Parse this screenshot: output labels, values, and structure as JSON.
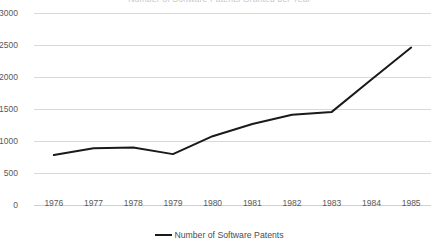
{
  "chart_data": {
    "type": "line",
    "title": "Number of Software Patents Granted per Year",
    "xlabel": "",
    "ylabel": "",
    "categories": [
      "1976",
      "1977",
      "1978",
      "1979",
      "1980",
      "1981",
      "1982",
      "1983",
      "1984",
      "1985"
    ],
    "series": [
      {
        "name": "Number of Software Patents",
        "values": [
          780,
          885,
          900,
          795,
          1075,
          1265,
          1410,
          1455,
          1960,
          2460
        ],
        "color": "#1a1a1a"
      }
    ],
    "ylim": [
      0,
      3000
    ],
    "yticks": [
      0,
      500,
      1000,
      1500,
      2000,
      2500,
      3000
    ],
    "ytick_labels": [
      "0",
      "500",
      "1000",
      "1500",
      "2000",
      "2500",
      "3000"
    ],
    "grid": true,
    "grid_color": "#d9d9d9",
    "legend_position": "bottom",
    "legend": [
      {
        "label": "Number of Software Patents",
        "color": "#1a1a1a"
      }
    ]
  }
}
